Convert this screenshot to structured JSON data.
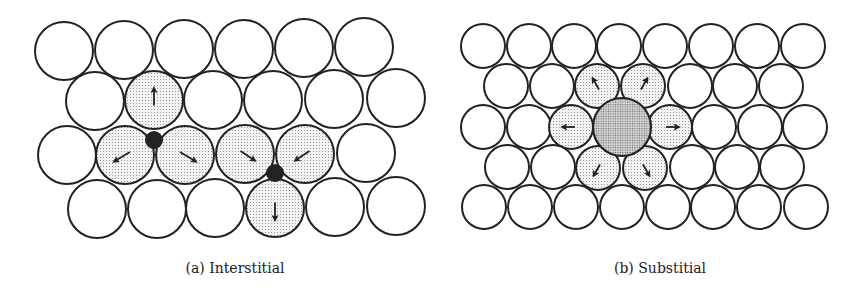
{
  "panels": [
    {
      "id": "a",
      "caption": "(a) Interstitial",
      "caption_pos": [
        235,
        260
      ],
      "atom_radius": 29,
      "atoms": [
        {
          "x": 64,
          "y": 51
        },
        {
          "x": 124,
          "y": 50
        },
        {
          "x": 184,
          "y": 49
        },
        {
          "x": 244,
          "y": 49
        },
        {
          "x": 304,
          "y": 48
        },
        {
          "x": 364,
          "y": 47
        },
        {
          "x": 95,
          "y": 101
        },
        {
          "x": 154,
          "y": 100,
          "strained": true,
          "arrow": [
            0,
            -22
          ]
        },
        {
          "x": 213,
          "y": 100
        },
        {
          "x": 273,
          "y": 100
        },
        {
          "x": 334,
          "y": 99
        },
        {
          "x": 396,
          "y": 98
        },
        {
          "x": 67,
          "y": 155
        },
        {
          "x": 125,
          "y": 155,
          "strained": true,
          "arrow": [
            -20,
            12
          ]
        },
        {
          "x": 185,
          "y": 155,
          "strained": true,
          "arrow": [
            20,
            12
          ]
        },
        {
          "x": 245,
          "y": 154,
          "strained": true,
          "arrow": [
            18,
            12
          ]
        },
        {
          "x": 305,
          "y": 154,
          "strained": true,
          "arrow": [
            -18,
            12
          ]
        },
        {
          "x": 366,
          "y": 153
        },
        {
          "x": 97,
          "y": 209
        },
        {
          "x": 157,
          "y": 209
        },
        {
          "x": 215,
          "y": 208
        },
        {
          "x": 275,
          "y": 208,
          "strained": true,
          "arrow": [
            0,
            22
          ]
        },
        {
          "x": 335,
          "y": 207
        },
        {
          "x": 396,
          "y": 206
        }
      ],
      "interstitials": [
        {
          "x": 154,
          "y": 140,
          "r": 9
        },
        {
          "x": 275,
          "y": 173,
          "r": 9
        }
      ]
    },
    {
      "id": "b",
      "caption": "(b) Substitial",
      "caption_pos": [
        660,
        260
      ],
      "atom_radius": 22,
      "atoms": [
        {
          "x": 483,
          "y": 46
        },
        {
          "x": 529,
          "y": 46
        },
        {
          "x": 574,
          "y": 46
        },
        {
          "x": 619,
          "y": 46
        },
        {
          "x": 665,
          "y": 46
        },
        {
          "x": 711,
          "y": 46
        },
        {
          "x": 757,
          "y": 46
        },
        {
          "x": 803,
          "y": 46
        },
        {
          "x": 506,
          "y": 86
        },
        {
          "x": 552,
          "y": 86
        },
        {
          "x": 597,
          "y": 86,
          "strained": true,
          "arrow": [
            -8,
            -14
          ]
        },
        {
          "x": 643,
          "y": 86,
          "strained": true,
          "arrow": [
            8,
            -14
          ]
        },
        {
          "x": 690,
          "y": 86
        },
        {
          "x": 735,
          "y": 86
        },
        {
          "x": 781,
          "y": 86
        },
        {
          "x": 483,
          "y": 127
        },
        {
          "x": 529,
          "y": 127
        },
        {
          "x": 571,
          "y": 127,
          "strained": true,
          "arrow": [
            -16,
            0
          ]
        },
        {
          "x": 670,
          "y": 127,
          "strained": true,
          "arrow": [
            16,
            0
          ]
        },
        {
          "x": 714,
          "y": 127
        },
        {
          "x": 760,
          "y": 127
        },
        {
          "x": 805,
          "y": 127
        },
        {
          "x": 507,
          "y": 167
        },
        {
          "x": 553,
          "y": 167
        },
        {
          "x": 598,
          "y": 168,
          "strained": true,
          "arrow": [
            -8,
            14
          ]
        },
        {
          "x": 645,
          "y": 168,
          "strained": true,
          "arrow": [
            8,
            14
          ]
        },
        {
          "x": 692,
          "y": 167
        },
        {
          "x": 737,
          "y": 167
        },
        {
          "x": 782,
          "y": 167
        },
        {
          "x": 484,
          "y": 207
        },
        {
          "x": 530,
          "y": 207
        },
        {
          "x": 576,
          "y": 207
        },
        {
          "x": 622,
          "y": 207
        },
        {
          "x": 668,
          "y": 207
        },
        {
          "x": 713,
          "y": 207
        },
        {
          "x": 759,
          "y": 207
        },
        {
          "x": 806,
          "y": 207
        }
      ],
      "substitutional": {
        "x": 622,
        "y": 127,
        "r": 29
      }
    }
  ],
  "colors": {
    "outline": "#222222",
    "strained_fill_dots": "#9a9a9a",
    "large_atom_dots": "#6e6e6e",
    "interstitial_fill": "#222222"
  }
}
